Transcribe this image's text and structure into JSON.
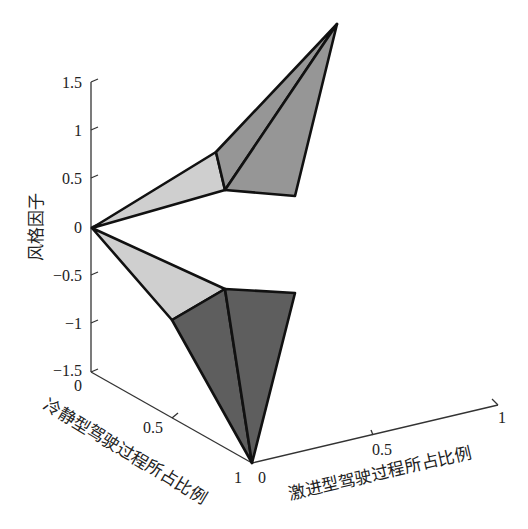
{
  "chart_data": {
    "type": "surface3d",
    "title": "",
    "zlabel": "风格因子",
    "xlabel": "冷静型驾驶过程所占比例",
    "ylabel": "激进型驾驶过程所占比例",
    "zlim": [
      -1.5,
      1.5
    ],
    "xlim": [
      0,
      1
    ],
    "ylim": [
      0,
      1
    ],
    "z_ticks": [
      "1.5",
      "1",
      "0.5",
      "0",
      "-0.5",
      "-1",
      "-1.5"
    ],
    "x_ticks": [
      "0",
      "0.5",
      "1"
    ],
    "y_ticks": [
      "0",
      "0.5",
      "1"
    ],
    "grid": false,
    "colors": {
      "light_face": "#cfcfcf",
      "mid_face": "#969696",
      "dark_face": "#5e5e5e",
      "edge": "#111111",
      "axis": "#333333"
    },
    "surfaces": [
      {
        "name": "upper",
        "vertices_z": {
          "origin": 0,
          "left_top": 0.75,
          "inner": 0.35,
          "right": 0.3,
          "peak": 2.1
        },
        "faces": [
          {
            "shade": "light",
            "points": [
              [
                92,
                228
              ],
              [
                216,
                152
              ],
              [
                225,
                190
              ]
            ]
          },
          {
            "shade": "mid",
            "points": [
              [
                216,
                152
              ],
              [
                337,
                24
              ],
              [
                225,
                190
              ]
            ]
          },
          {
            "shade": "mid",
            "points": [
              [
                225,
                190
              ],
              [
                337,
                24
              ],
              [
                295,
                196
              ]
            ]
          }
        ]
      },
      {
        "name": "lower",
        "vertices_z": {
          "origin": 0,
          "left": -0.95,
          "inner": -0.65,
          "right": -0.7,
          "bottom": -2.5
        },
        "faces": [
          {
            "shade": "light",
            "points": [
              [
                92,
                228
              ],
              [
                225,
                289
              ],
              [
                172,
                320
              ]
            ]
          },
          {
            "shade": "dark",
            "points": [
              [
                172,
                320
              ],
              [
                225,
                289
              ],
              [
                252,
                463
              ]
            ]
          },
          {
            "shade": "dark",
            "points": [
              [
                225,
                289
              ],
              [
                295,
                293
              ],
              [
                252,
                463
              ]
            ]
          }
        ]
      }
    ]
  },
  "axis": {
    "z_title": "风格因子",
    "x_title": "冷静型驾驶过程所占比例",
    "y_title": "激进型驾驶过程所占比例",
    "z_ticks": [
      "1.5",
      "1",
      "0.5",
      "0",
      "−0.5",
      "−1",
      "−1.5"
    ],
    "x_ticks": [
      "0",
      "0.5",
      "1"
    ],
    "y_ticks": [
      "0",
      "0.5",
      "1"
    ]
  }
}
